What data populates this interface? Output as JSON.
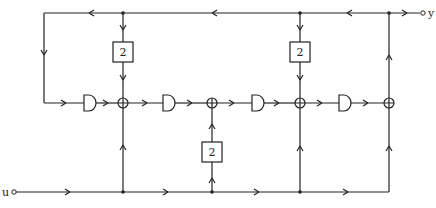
{
  "diagram": {
    "type": "block-diagram",
    "input_label": "u",
    "output_label": "y",
    "gain_blocks": [
      {
        "id": "g1",
        "label": "2",
        "position": "top-left feedback"
      },
      {
        "id": "g2",
        "label": "2",
        "position": "bottom feedforward"
      },
      {
        "id": "g3",
        "label": "2",
        "position": "top-right feedback"
      }
    ],
    "delay_elements": 4,
    "summing_junctions": 4,
    "colors": {
      "line": "#222222",
      "background": "#ffffff"
    }
  }
}
